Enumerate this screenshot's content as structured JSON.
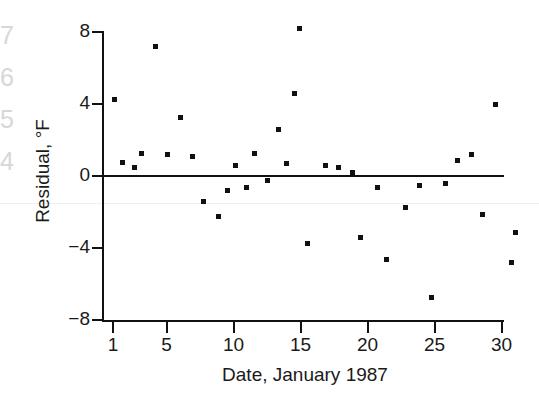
{
  "figure": {
    "margin_ghost_text": "7\n6\n5\n4",
    "background_color": "#ffffff",
    "point_color": "#111111",
    "axis_color": "#111111"
  },
  "chart_data": {
    "type": "scatter",
    "title": "",
    "xlabel": "Date, January 1987",
    "ylabel": "Residual, °F",
    "ylabel_text": "Residual, ",
    "ylabel_unit": "°F",
    "xlim": [
      0,
      31.8
    ],
    "ylim": [
      -8,
      8
    ],
    "xticks": [
      1,
      5,
      10,
      15,
      20,
      25,
      30
    ],
    "xtick_labels": [
      "1",
      "5",
      "10",
      "15",
      "20",
      "25",
      "30"
    ],
    "yticks": [
      8,
      4,
      0,
      -4,
      -8
    ],
    "ytick_labels": [
      "8",
      "4",
      "0",
      "−4",
      "−8"
    ],
    "grid": false,
    "legend": false,
    "zero_reference_line": true,
    "x": [
      1.1,
      1.7,
      2.6,
      3.1,
      4.1,
      5.0,
      6.0,
      6.9,
      7.7,
      8.8,
      9.5,
      10.1,
      10.9,
      11.5,
      12.5,
      13.3,
      13.9,
      14.5,
      14.9,
      15.5,
      16.8,
      17.8,
      18.8,
      19.4,
      20.7,
      21.4,
      22.8,
      23.8,
      24.7,
      25.8,
      26.7,
      27.7,
      28.5,
      29.5,
      30.7,
      31.0
    ],
    "y": [
      4.3,
      0.8,
      0.5,
      1.3,
      7.2,
      1.2,
      3.3,
      1.1,
      -1.4,
      -2.2,
      -0.8,
      0.6,
      -0.6,
      1.3,
      -0.2,
      2.6,
      0.7,
      4.6,
      8.2,
      -3.7,
      0.6,
      0.5,
      0.2,
      -3.4,
      -0.6,
      -4.6,
      -1.7,
      -0.5,
      -6.7,
      -0.4,
      0.9,
      1.2,
      -2.1,
      4.0,
      -4.8,
      -3.1
    ],
    "points": [
      {
        "day": 1.1,
        "residual": 4.3
      },
      {
        "day": 1.7,
        "residual": 0.8
      },
      {
        "day": 2.6,
        "residual": 0.5
      },
      {
        "day": 3.1,
        "residual": 1.3
      },
      {
        "day": 4.1,
        "residual": 7.2
      },
      {
        "day": 5.0,
        "residual": 1.2
      },
      {
        "day": 6.0,
        "residual": 3.3
      },
      {
        "day": 6.9,
        "residual": 1.1
      },
      {
        "day": 7.7,
        "residual": -1.4
      },
      {
        "day": 8.8,
        "residual": -2.2
      },
      {
        "day": 9.5,
        "residual": -0.8
      },
      {
        "day": 10.1,
        "residual": 0.6
      },
      {
        "day": 10.9,
        "residual": -0.6
      },
      {
        "day": 11.5,
        "residual": 1.3
      },
      {
        "day": 12.5,
        "residual": -0.2
      },
      {
        "day": 13.3,
        "residual": 2.6
      },
      {
        "day": 13.9,
        "residual": 0.7
      },
      {
        "day": 14.5,
        "residual": 4.6
      },
      {
        "day": 14.9,
        "residual": 8.2
      },
      {
        "day": 15.5,
        "residual": -3.7
      },
      {
        "day": 16.8,
        "residual": 0.6
      },
      {
        "day": 17.8,
        "residual": 0.5
      },
      {
        "day": 18.8,
        "residual": 0.2
      },
      {
        "day": 19.4,
        "residual": -3.4
      },
      {
        "day": 20.7,
        "residual": -0.6
      },
      {
        "day": 21.4,
        "residual": -4.6
      },
      {
        "day": 22.8,
        "residual": -1.7
      },
      {
        "day": 23.8,
        "residual": -0.5
      },
      {
        "day": 24.7,
        "residual": -6.7
      },
      {
        "day": 25.8,
        "residual": -0.4
      },
      {
        "day": 26.7,
        "residual": 0.9
      },
      {
        "day": 27.7,
        "residual": 1.2
      },
      {
        "day": 28.5,
        "residual": -2.1
      },
      {
        "day": 29.5,
        "residual": 4.0
      },
      {
        "day": 30.7,
        "residual": -4.8
      },
      {
        "day": 31.0,
        "residual": -3.1
      }
    ]
  }
}
